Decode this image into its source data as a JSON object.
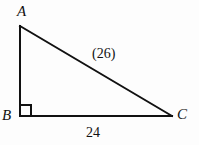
{
  "figure": {
    "kind": "right-triangle-diagram",
    "background_color": "#fdfdfd",
    "stroke_color": "#111111",
    "stroke_width": 2,
    "width": 199,
    "height": 145
  },
  "vertices": {
    "a": {
      "label": "A",
      "x": 20,
      "y": 26
    },
    "b": {
      "label": "B",
      "x": 20,
      "y": 116
    },
    "c": {
      "label": "C",
      "x": 172,
      "y": 116
    }
  },
  "sides": {
    "hypotenuse": {
      "label": "(26)",
      "value": 26,
      "from": "A",
      "to": "C"
    },
    "base": {
      "label": "24",
      "value": 24,
      "from": "B",
      "to": "C"
    },
    "vertical": {
      "label": "",
      "from": "A",
      "to": "B"
    }
  },
  "right_angle": {
    "at_vertex": "B",
    "marker": "square",
    "size": 11
  }
}
